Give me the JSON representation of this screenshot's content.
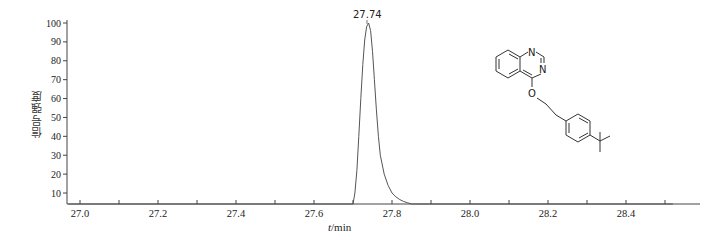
{
  "chart_data": {
    "type": "line",
    "title": "",
    "xlabel": "t/min",
    "xlabel_italic_part": "t",
    "xlabel_unit_part": "/min",
    "ylabel": "信号强度",
    "xlim": [
      26.97,
      28.52
    ],
    "ylim": [
      4,
      102
    ],
    "x_ticks": [
      27.0,
      27.2,
      27.4,
      27.6,
      27.8,
      28.0,
      28.2,
      28.4
    ],
    "x_tick_labels": [
      "27.0",
      "27.2",
      "27.4",
      "27.6",
      "27.8",
      "28.0",
      "28.2",
      "28.4"
    ],
    "x_minor_step": 0.1,
    "y_ticks": [
      10,
      20,
      30,
      40,
      50,
      60,
      70,
      80,
      90,
      100
    ],
    "y_tick_labels": [
      "10",
      "20",
      "30",
      "40",
      "50",
      "60",
      "70",
      "80",
      "90",
      "100"
    ],
    "grid": false,
    "legend": null,
    "series": [
      {
        "name": "chromatogram",
        "color": "#555555",
        "x": [
          26.97,
          27.7,
          27.705,
          27.71,
          27.715,
          27.72,
          27.725,
          27.73,
          27.735,
          27.74,
          27.745,
          27.75,
          27.755,
          27.76,
          27.765,
          27.77,
          27.78,
          27.79,
          27.8,
          27.81,
          27.82,
          27.83,
          27.84,
          27.85,
          28.52
        ],
        "values": [
          4,
          4,
          10,
          22,
          40,
          60,
          78,
          91,
          98,
          100,
          96,
          85,
          70,
          54,
          40,
          30,
          20,
          14,
          10,
          8,
          6.5,
          5.5,
          4.8,
          4,
          4
        ]
      }
    ],
    "annotations": [
      {
        "text": "27.74",
        "x": 27.74,
        "y": 100,
        "type": "peak-label"
      }
    ],
    "inset": {
      "type": "chemical-structure",
      "description": "4-[2-(4-tert-butylphenyl)ethoxy]quinazoline",
      "atom_labels": [
        "N",
        "N",
        "O"
      ]
    }
  }
}
